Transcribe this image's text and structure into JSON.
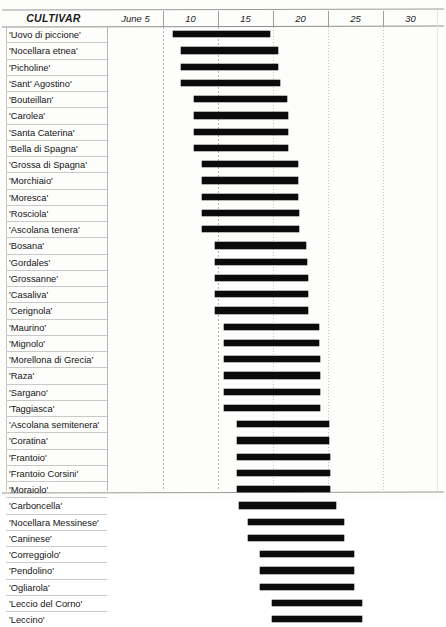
{
  "header": {
    "cultivar_label": "CULTIVAR",
    "ticks": [
      {
        "label": "June 5",
        "value": 5
      },
      {
        "label": "10",
        "value": 10
      },
      {
        "label": "15",
        "value": 15
      },
      {
        "label": "20",
        "value": 20
      },
      {
        "label": "25",
        "value": 25
      },
      {
        "label": "30",
        "value": 30
      }
    ]
  },
  "chart_data": {
    "type": "bar",
    "title": "",
    "xlabel": "",
    "ylabel": "CULTIVAR",
    "orientation": "horizontal",
    "bar_kind": "range",
    "xlim": [
      2.5,
      32.5
    ],
    "grid": true,
    "axis_unit": "day of June",
    "categories": [
      "'Uovo di piccione'",
      "'Nocellara etnea'",
      "'Picholine'",
      "'Sant' Agostino'",
      "'Bouteillan'",
      "'Carolea'",
      "'Santa Caterina'",
      "'Bella di Spagna'",
      "'Grossa di Spagna'",
      "'Morchiaio'",
      "'Moresca'",
      "'Rosciola'",
      "'Ascolana tenera'",
      "'Bosana'",
      "'Gordales'",
      "'Grossanne'",
      "'Casaliva'",
      "'Cerignola'",
      "'Maurino'",
      "'Mignolo'",
      "'Morellona di Grecia'",
      "'Raza'",
      "'Sargano'",
      "'Taggiasca'",
      "'Ascolana semitenera'",
      "'Coratina'",
      "'Frantoio'",
      "'Frantoio Corsini'",
      "'Moraiolo'",
      "'Carboncella'",
      "'Nocellara Messinese'",
      "'Caninese'",
      "'Correggiolo'",
      "'Pendolino'",
      "'Ogliarola'",
      "'Leccio del Corno'",
      "'Leccino'"
    ],
    "series": [
      {
        "name": "Flowering period",
        "ranges": [
          {
            "start": 8.4,
            "end": 17.2
          },
          {
            "start": 9.1,
            "end": 18.0
          },
          {
            "start": 9.1,
            "end": 18.0
          },
          {
            "start": 9.1,
            "end": 18.1
          },
          {
            "start": 10.3,
            "end": 18.8
          },
          {
            "start": 10.3,
            "end": 18.9
          },
          {
            "start": 10.3,
            "end": 18.9
          },
          {
            "start": 10.3,
            "end": 18.9
          },
          {
            "start": 11.0,
            "end": 19.8
          },
          {
            "start": 11.0,
            "end": 19.8
          },
          {
            "start": 11.0,
            "end": 19.8
          },
          {
            "start": 11.0,
            "end": 19.9
          },
          {
            "start": 11.0,
            "end": 19.9
          },
          {
            "start": 12.2,
            "end": 20.5
          },
          {
            "start": 12.2,
            "end": 20.6
          },
          {
            "start": 12.2,
            "end": 20.7
          },
          {
            "start": 12.2,
            "end": 20.7
          },
          {
            "start": 12.2,
            "end": 20.7
          },
          {
            "start": 13.0,
            "end": 21.7
          },
          {
            "start": 13.0,
            "end": 21.7
          },
          {
            "start": 13.0,
            "end": 21.8
          },
          {
            "start": 13.0,
            "end": 21.8
          },
          {
            "start": 13.0,
            "end": 21.8
          },
          {
            "start": 13.0,
            "end": 21.8
          },
          {
            "start": 14.2,
            "end": 22.6
          },
          {
            "start": 14.2,
            "end": 22.6
          },
          {
            "start": 14.2,
            "end": 22.7
          },
          {
            "start": 14.2,
            "end": 22.7
          },
          {
            "start": 14.2,
            "end": 22.7
          },
          {
            "start": 14.4,
            "end": 23.2
          },
          {
            "start": 15.2,
            "end": 24.0
          },
          {
            "start": 15.2,
            "end": 24.0
          },
          {
            "start": 16.3,
            "end": 24.9
          },
          {
            "start": 16.3,
            "end": 24.9
          },
          {
            "start": 16.3,
            "end": 24.9
          },
          {
            "start": 17.4,
            "end": 25.6
          },
          {
            "start": 17.4,
            "end": 25.6
          }
        ]
      }
    ]
  }
}
